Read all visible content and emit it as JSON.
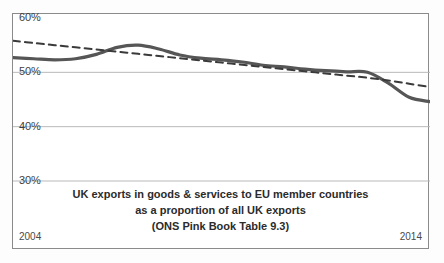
{
  "chart_data": {
    "type": "line",
    "title": "UK exports in goods & services to EU member countries as a proportion of all UK exports (ONS Pink Book Table 9.3)",
    "title_lines": [
      "UK exports in goods & services to EU member countries",
      "as a proportion of all UK exports",
      "(ONS Pink Book Table 9.3)"
    ],
    "xlabel": "",
    "ylabel": "",
    "ylim": [
      30,
      60
    ],
    "xlim": [
      2004,
      2014
    ],
    "grid": true,
    "legend": "none",
    "y_ticks": [
      "60%",
      "50%",
      "40%",
      "30%"
    ],
    "y_tick_values": [
      60,
      50,
      40,
      30
    ],
    "x_ticks": [
      "2004",
      "2014"
    ],
    "x_tick_values": [
      2004,
      2014
    ],
    "x": [
      2004,
      2004.5,
      2005,
      2005.5,
      2006,
      2006.5,
      2007,
      2007.5,
      2008,
      2008.5,
      2009,
      2009.5,
      2010,
      2010.5,
      2011,
      2011.5,
      2012,
      2012.5,
      2013,
      2013.5,
      2014
    ],
    "series": [
      {
        "name": "UK exports to EU as share of all UK exports",
        "style": "solid",
        "color": "#565656",
        "width": 3.2,
        "values": [
          52.7,
          52.5,
          52.3,
          52.5,
          53.3,
          54.6,
          55.0,
          54.3,
          53.2,
          52.6,
          52.3,
          51.9,
          51.3,
          51.0,
          50.6,
          50.3,
          50.1,
          50.0,
          48.0,
          45.4,
          44.6
        ]
      },
      {
        "name": "Linear trend",
        "style": "dashed",
        "color": "#3a3a3a",
        "width": 2.0,
        "values": [
          55.8,
          55.4,
          55.0,
          54.6,
          54.2,
          53.8,
          53.4,
          53.0,
          52.6,
          52.2,
          51.8,
          51.4,
          51.0,
          50.6,
          50.2,
          49.8,
          49.4,
          49.0,
          48.5,
          47.9,
          47.3
        ]
      }
    ]
  },
  "axis": {
    "y_labels": [
      {
        "text": "60%",
        "value": 60
      },
      {
        "text": "50%",
        "value": 50
      },
      {
        "text": "40%",
        "value": 40
      },
      {
        "text": "30%",
        "value": 30
      }
    ],
    "x_start_label": "2004",
    "x_end_label": "2014"
  },
  "caption": {
    "line1": "UK exports in goods & services to EU member countries",
    "line2": "as a proportion of all UK exports",
    "line3": "(ONS Pink Book Table 9.3)"
  },
  "colors": {
    "series_line": "#565656",
    "trend_line": "#3a3a3a",
    "gridline": "#b9b9b9",
    "frame": "#8b8b8b",
    "text": "#2b2b2b",
    "background": "#ffffff"
  }
}
